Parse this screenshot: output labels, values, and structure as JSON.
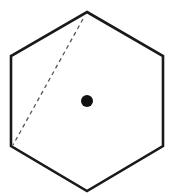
{
  "diagram": {
    "shape": "regular-hexagon",
    "stroke_color": "#1a1a1a",
    "fill_color": "#ffffff",
    "vertices": [
      [
        87,
        12
      ],
      [
        163,
        56
      ],
      [
        163,
        146
      ],
      [
        87,
        191
      ],
      [
        11,
        146
      ],
      [
        11,
        56
      ]
    ],
    "dashed_line": {
      "from": [
        83,
        19
      ],
      "to": [
        13,
        145
      ],
      "color": "#555555"
    },
    "center_dot": {
      "cx": 87,
      "cy": 101,
      "r": 6,
      "color": "#111111"
    }
  }
}
